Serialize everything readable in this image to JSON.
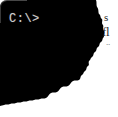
{
  "screenshot": {
    "width": 118,
    "height": 117,
    "background_color": "#ffffff"
  },
  "terminal": {
    "name": "command-prompt-fragment",
    "background_color": "#000000",
    "text_color": "#cfcfcf",
    "prompt": "C:\\>",
    "corner_style": "rounded-top-left",
    "edge_style": "torn-ragged-right-and-bottom"
  },
  "background_page": {
    "text_color": "#2b2b2b",
    "clipped_lines": [
      {
        "text": "s",
        "note": "clipped-by-torn-edge"
      },
      {
        "text": "fl",
        "note": "clipped-by-torn-edge"
      },
      {
        "text": "..",
        "note": "clipped-by-torn-edge"
      }
    ]
  }
}
